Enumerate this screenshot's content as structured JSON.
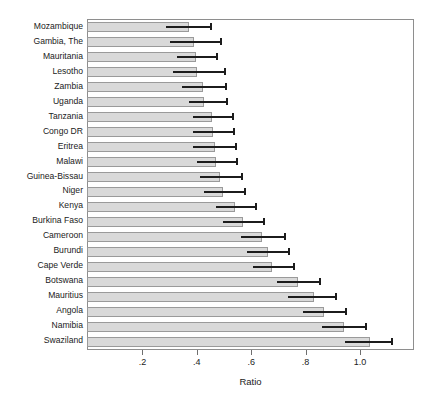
{
  "chart_data": {
    "type": "bar",
    "orientation": "horizontal",
    "title": "",
    "subtitle": "",
    "xlabel": "Ratio",
    "ylabel": "",
    "xlim": [
      0.0,
      1.195
    ],
    "xticks": [
      0.2,
      0.4,
      0.6,
      0.8,
      1.0
    ],
    "xtick_labels": [
      ".2",
      ".4",
      ".6",
      ".8",
      "1.0"
    ],
    "grid": false,
    "legend": null,
    "error_bars": "confidence interval line with right end cap",
    "bar_color": "#d9d9d9",
    "bar_border_color": "#9a9a9a",
    "error_color": "#1c1c1c",
    "frame_color": "#8e8e8e",
    "categories": [
      "Mozambique",
      "Gambia, The",
      "Mauritania",
      "Lesotho",
      "Zambia",
      "Uganda",
      "Tanzania",
      "Congo DR",
      "Eritrea",
      "Malawi",
      "Guinea-Bissau",
      "Niger",
      "Kenya",
      "Burkina Faso",
      "Cameroon",
      "Burundi",
      "Cape Verde",
      "Botswana",
      "Mauritius",
      "Angola",
      "Namibia",
      "Swaziland"
    ],
    "values": [
      0.375,
      0.395,
      0.4,
      0.405,
      0.425,
      0.43,
      0.46,
      0.465,
      0.47,
      0.475,
      0.49,
      0.5,
      0.545,
      0.575,
      0.645,
      0.665,
      0.68,
      0.775,
      0.835,
      0.87,
      0.945,
      1.04
    ],
    "ci_low": [
      0.29,
      0.305,
      0.33,
      0.315,
      0.35,
      0.375,
      0.39,
      0.39,
      0.39,
      0.405,
      0.415,
      0.43,
      0.475,
      0.5,
      0.565,
      0.59,
      0.61,
      0.7,
      0.74,
      0.795,
      0.865,
      0.95
    ],
    "ci_high": [
      0.46,
      0.495,
      0.48,
      0.51,
      0.515,
      0.52,
      0.54,
      0.545,
      0.55,
      0.555,
      0.575,
      0.585,
      0.625,
      0.655,
      0.73,
      0.745,
      0.765,
      0.86,
      0.92,
      0.955,
      1.03,
      1.125
    ]
  }
}
